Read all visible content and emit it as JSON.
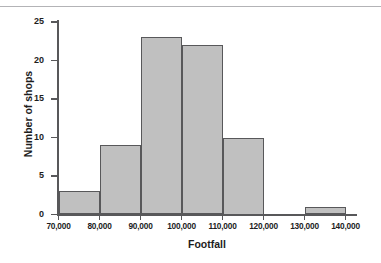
{
  "chart_data": {
    "type": "bar",
    "title": "",
    "subtitle": "",
    "xlabel": "Footfall",
    "ylabel": "Number of shops",
    "categories": [
      "70,000-80,000",
      "80,000-90,000",
      "90,000-100,000",
      "100,000-110,000",
      "110,000-120,000",
      "120,000-130,000",
      "130,000-140,000"
    ],
    "bin_edges": [
      70000,
      80000,
      90000,
      100000,
      110000,
      120000,
      130000,
      140000
    ],
    "values": [
      3,
      9,
      23,
      22,
      10,
      0,
      1
    ],
    "xlim": [
      70000,
      140000
    ],
    "ylim": [
      0,
      25
    ],
    "ytick_labels": [
      "0",
      "5",
      "10",
      "15",
      "20",
      "25"
    ],
    "ytick_values": [
      0,
      5,
      10,
      15,
      20,
      25
    ],
    "xtick_labels": [
      "70,000",
      "80,000",
      "90,000",
      "100,000",
      "110,000",
      "120,000",
      "130,000",
      "140,000"
    ],
    "xtick_values": [
      70000,
      80000,
      90000,
      100000,
      110000,
      120000,
      130000,
      140000
    ],
    "grid": false,
    "legend": null,
    "bar_fill_color": "#c0c0c0",
    "bar_edge_color": "#58585a",
    "axis_color": "#58585a",
    "text_color": "#1d1d1d",
    "background_color": "#ffffff"
  }
}
